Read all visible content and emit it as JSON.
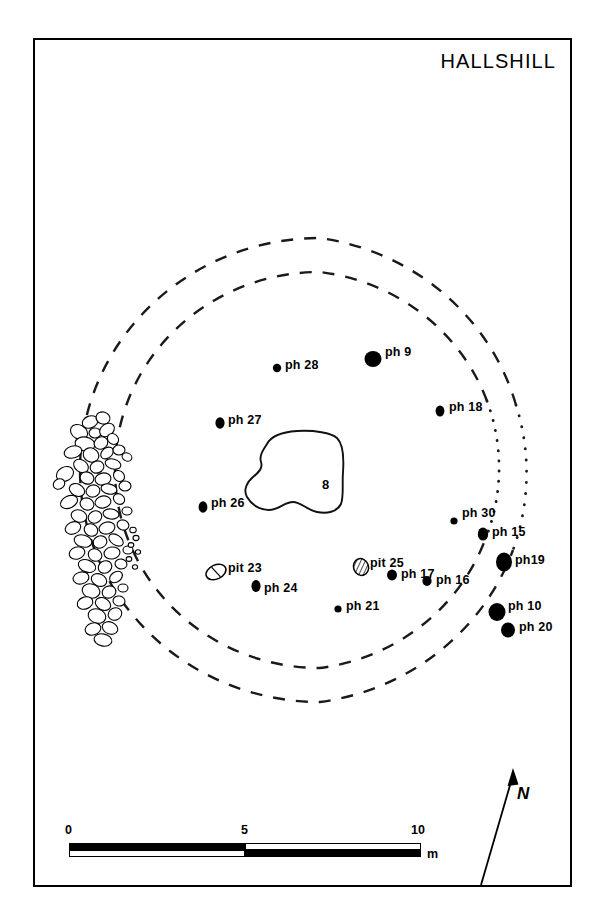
{
  "title": "HALLSHILL",
  "domain_note": "archaeological site plan",
  "central_feature": {
    "label": "8"
  },
  "scale": {
    "ticks": [
      "0",
      "5",
      "10"
    ],
    "unit": "m",
    "segments": 2,
    "max_metres": 10
  },
  "north": {
    "label": "N"
  },
  "features": [
    {
      "id": "ph28",
      "label": "ph 28",
      "type": "posthole-filled",
      "cx": 242,
      "cy": 328,
      "rx": 4.2,
      "ry": 4.2,
      "lx": 250,
      "ly": 318
    },
    {
      "id": "ph9",
      "label": "ph 9",
      "type": "posthole-filled",
      "cx": 338,
      "cy": 319,
      "rx": 8.5,
      "ry": 8.0,
      "lx": 350,
      "ly": 305
    },
    {
      "id": "ph18",
      "label": "ph 18",
      "type": "posthole-filled",
      "cx": 405,
      "cy": 371,
      "rx": 4.4,
      "ry": 5.6,
      "lx": 414,
      "ly": 360
    },
    {
      "id": "ph27",
      "label": "ph 27",
      "type": "posthole-filled",
      "cx": 185,
      "cy": 383,
      "rx": 4.6,
      "ry": 5.8,
      "lx": 193,
      "ly": 373
    },
    {
      "id": "ph26",
      "label": "ph 26",
      "type": "posthole-filled",
      "cx": 168,
      "cy": 467,
      "rx": 4.4,
      "ry": 5.8,
      "lx": 176,
      "ly": 456
    },
    {
      "id": "ph30",
      "label": "ph 30",
      "type": "posthole-filled",
      "cx": 419,
      "cy": 481,
      "rx": 3.6,
      "ry": 3.6,
      "lx": 427,
      "ly": 466
    },
    {
      "id": "ph15",
      "label": "ph 15",
      "type": "posthole-filled",
      "cx": 448,
      "cy": 494,
      "rx": 5.2,
      "ry": 6.6,
      "lx": 457,
      "ly": 485
    },
    {
      "id": "ph19",
      "label": "ph19",
      "type": "posthole-filled",
      "cx": 469,
      "cy": 522,
      "rx": 8.0,
      "ry": 9.4,
      "lx": 480,
      "ly": 513
    },
    {
      "id": "pit23",
      "label": "pit 23",
      "type": "pit-outline",
      "cx": 181,
      "cy": 532,
      "rx": 10.5,
      "ry": 7.0,
      "lx": 193,
      "ly": 521
    },
    {
      "id": "pit25",
      "label": "pit 25",
      "type": "pit-hatched",
      "cx": 326,
      "cy": 527,
      "rx": 7.5,
      "ry": 8.5,
      "lx": 335,
      "ly": 516
    },
    {
      "id": "ph17",
      "label": "ph 17",
      "type": "posthole-filled",
      "cx": 357,
      "cy": 535,
      "rx": 5.0,
      "ry": 5.4,
      "lx": 366,
      "ly": 527
    },
    {
      "id": "ph16",
      "label": "ph 16",
      "type": "posthole-filled",
      "cx": 392,
      "cy": 541,
      "rx": 4.6,
      "ry": 5.0,
      "lx": 401,
      "ly": 533
    },
    {
      "id": "ph24",
      "label": "ph 24",
      "type": "posthole-filled",
      "cx": 221,
      "cy": 546,
      "rx": 4.6,
      "ry": 6.0,
      "lx": 229,
      "ly": 541
    },
    {
      "id": "ph21",
      "label": "ph 21",
      "type": "posthole-filled",
      "cx": 303,
      "cy": 569,
      "rx": 3.6,
      "ry": 3.6,
      "lx": 311,
      "ly": 559
    },
    {
      "id": "ph10",
      "label": "ph 10",
      "type": "posthole-filled",
      "cx": 462,
      "cy": 572,
      "rx": 8.5,
      "ry": 9.0,
      "lx": 473,
      "ly": 559
    },
    {
      "id": "ph20",
      "label": "ph 20",
      "type": "posthole-filled",
      "cx": 473,
      "cy": 590,
      "rx": 7.0,
      "ry": 7.5,
      "lx": 484,
      "ly": 580
    }
  ],
  "rings": [
    {
      "id": "outer-ditch",
      "style": "dashed-then-dotted",
      "cx": 285,
      "cy": 430,
      "rx": 240,
      "ry": 232
    },
    {
      "id": "inner-ditch",
      "style": "dashed-then-dotted",
      "cx": 285,
      "cy": 430,
      "rx": 205,
      "ry": 198
    }
  ],
  "stone_scatter": {
    "id": "stone-spread",
    "description": "dense stone / rubble spread on west side"
  }
}
